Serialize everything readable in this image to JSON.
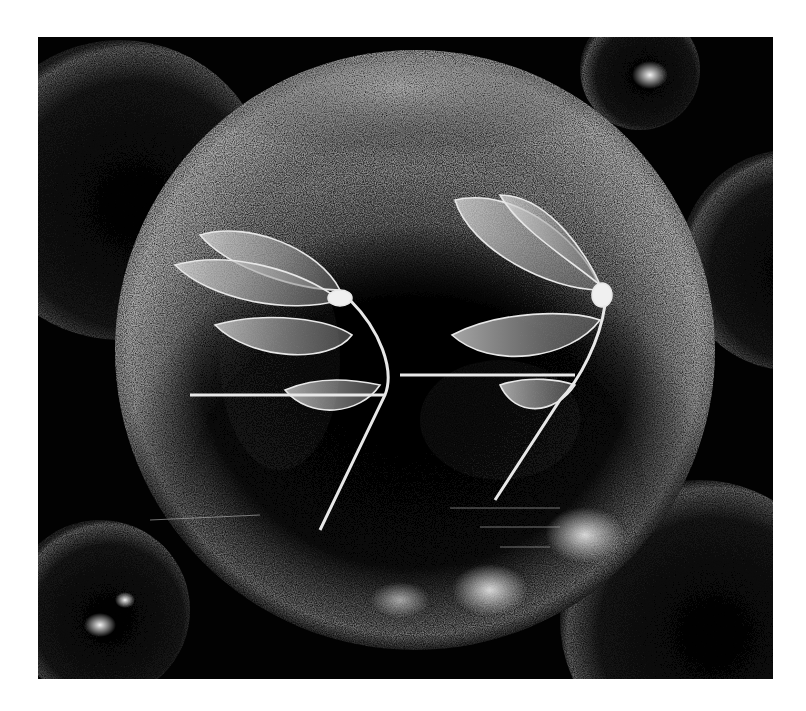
{
  "artwork": {
    "medium": "scratchboard-style black and white illustration",
    "subject": "two winged insects inside a large glass sphere",
    "colors": {
      "background": "#020202",
      "page": "#ffffff",
      "highlight": "#e8e8e8",
      "midtone": "#8a8a8a"
    },
    "panel": {
      "x": 38,
      "y": 37,
      "width": 735,
      "height": 642
    },
    "main_sphere": {
      "cx": 415,
      "cy": 350,
      "r": 300
    },
    "insects": [
      {
        "name": "left-insect",
        "head_x": 338,
        "head_y": 300
      },
      {
        "name": "right-insect",
        "head_x": 600,
        "head_y": 290
      }
    ]
  }
}
